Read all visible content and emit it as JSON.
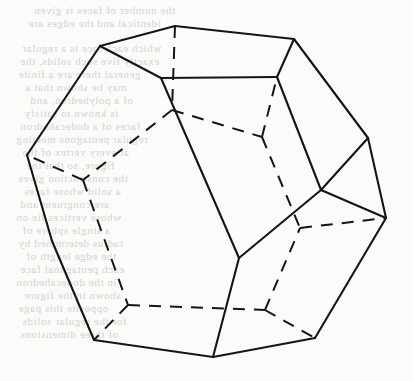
{
  "figure": {
    "name": "dodecahedron-wireframe",
    "title": "Regular dodecahedron",
    "solid_type": "dodecahedron",
    "faces": 12,
    "vertices": 20,
    "edges": 30,
    "projection": "oblique",
    "line_color": "#151515",
    "background_color": "#fbfbfa",
    "bleed_text_color": "#cfcdc9",
    "canvas": {
      "width": 413,
      "height": 381
    },
    "geometry": {
      "points": {
        "t_apex": [
          175,
          26
        ],
        "t_right": [
          294,
          39
        ],
        "t_nearright": [
          277,
          77
        ],
        "t_nearleft": [
          161,
          78
        ],
        "t_left": [
          100,
          46
        ],
        "m_left": [
          27,
          155
        ],
        "m_lowleft": [
          52,
          241
        ],
        "m_right": [
          368,
          138
        ],
        "m_lowright": [
          386,
          218
        ],
        "c_right": [
          321,
          190
        ],
        "c_bottom": [
          239,
          258
        ],
        "b_left": [
          94,
          340
        ],
        "b_center": [
          213,
          357
        ],
        "b_right": [
          315,
          338
        ],
        "h_upper": [
          172,
          110
        ],
        "h_left": [
          83,
          180
        ],
        "h_right": [
          262,
          137
        ],
        "h_rightlow": [
          300,
          228
        ],
        "h_lowleft": [
          128,
          305
        ],
        "h_lowright": [
          265,
          310
        ]
      },
      "visible_edges": [
        [
          "t_apex",
          "t_right"
        ],
        [
          "t_right",
          "t_nearright"
        ],
        [
          "t_nearright",
          "t_nearleft"
        ],
        [
          "t_nearleft",
          "t_left"
        ],
        [
          "t_left",
          "t_apex"
        ],
        [
          "t_left",
          "m_left"
        ],
        [
          "t_right",
          "m_right"
        ],
        [
          "t_nearleft",
          "c_bottom"
        ],
        [
          "t_nearright",
          "c_right"
        ],
        [
          "c_right",
          "c_bottom"
        ],
        [
          "m_left",
          "m_lowleft"
        ],
        [
          "m_right",
          "c_right"
        ],
        [
          "m_right",
          "m_lowright"
        ],
        [
          "m_lowright",
          "c_right"
        ],
        [
          "m_lowleft",
          "b_left"
        ],
        [
          "m_lowright",
          "b_right"
        ],
        [
          "b_left",
          "b_center"
        ],
        [
          "b_center",
          "b_right"
        ],
        [
          "b_center",
          "c_bottom"
        ]
      ],
      "hidden_edges": [
        [
          "t_apex",
          "h_upper"
        ],
        [
          "h_upper",
          "h_left"
        ],
        [
          "h_upper",
          "h_right"
        ],
        [
          "h_left",
          "m_left"
        ],
        [
          "h_right",
          "t_nearright"
        ],
        [
          "h_right",
          "h_rightlow"
        ],
        [
          "h_rightlow",
          "m_lowright"
        ],
        [
          "h_left",
          "h_lowleft"
        ],
        [
          "h_lowleft",
          "b_left"
        ],
        [
          "h_lowleft",
          "h_lowright"
        ],
        [
          "h_lowright",
          "h_rightlow"
        ],
        [
          "h_lowright",
          "b_right"
        ]
      ]
    }
  },
  "bleed_through": {
    "visible": true,
    "note": "Faint mirrored text showing through from the reverse side of the page.",
    "lines": [
      {
        "top": 4,
        "left": 34,
        "text": "the number of faces is given"
      },
      {
        "top": 17,
        "left": 28,
        "text": "identical and the edges are"
      },
      {
        "top": 42,
        "left": 22,
        "text": "which each face is a regular"
      },
      {
        "top": 55,
        "left": 20,
        "text": "exactly five such solids, the"
      },
      {
        "top": 68,
        "left": 18,
        "text": "general there are a finite"
      },
      {
        "top": 81,
        "left": 25,
        "text": "may be shown that a"
      },
      {
        "top": 94,
        "left": 30,
        "text": "of a polyhedron, and"
      },
      {
        "top": 107,
        "left": 24,
        "text": "is known to satisfy"
      },
      {
        "top": 120,
        "left": 20,
        "text": "faces of a dodecahedron"
      },
      {
        "top": 133,
        "left": 16,
        "text": "regular pentagons meeting"
      },
      {
        "top": 146,
        "left": 22,
        "text": "at every vertex of the"
      },
      {
        "top": 159,
        "left": 26,
        "text": "figure, so that the"
      },
      {
        "top": 172,
        "left": 18,
        "text": "the construction gives"
      },
      {
        "top": 185,
        "left": 24,
        "text": "a solid whose faces"
      },
      {
        "top": 198,
        "left": 20,
        "text": "are congruent and"
      },
      {
        "top": 211,
        "left": 16,
        "text": "whose vertices lie on"
      },
      {
        "top": 224,
        "left": 22,
        "text": "a single sphere of"
      },
      {
        "top": 237,
        "left": 18,
        "text": "radius determined by"
      },
      {
        "top": 250,
        "left": 26,
        "text": "the edge length of"
      },
      {
        "top": 263,
        "left": 20,
        "text": "each pentagonal face"
      },
      {
        "top": 276,
        "left": 16,
        "text": "in the dodecahedron"
      },
      {
        "top": 289,
        "left": 24,
        "text": "shown in the figure"
      },
      {
        "top": 302,
        "left": 18,
        "text": "opposite this page"
      },
      {
        "top": 315,
        "left": 22,
        "text": "for the regular solids"
      },
      {
        "top": 328,
        "left": 20,
        "text": "of three dimensions"
      }
    ]
  }
}
